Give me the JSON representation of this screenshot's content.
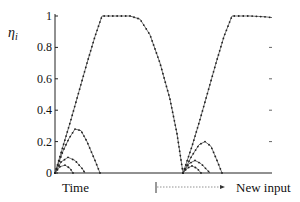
{
  "chart_data": {
    "type": "line",
    "title": "",
    "ylabel": "η_i",
    "ylabel_main": "η",
    "ylabel_sub": "i",
    "xlabel": "Time",
    "annotation": "New input",
    "ylim": [
      0,
      1
    ],
    "yticks": [
      "0",
      "0.2",
      "0.4",
      "0.6",
      "0.8",
      "1"
    ],
    "grid": false,
    "legend": null,
    "x_units": "arbitrary (pixel-proportional time, 0 = origin, 217 = end of axis)",
    "series": [
      {
        "name": "winner (main curve)",
        "marker": "dot",
        "points": [
          [
            0,
            0
          ],
          [
            8,
            0.17
          ],
          [
            16,
            0.34
          ],
          [
            24,
            0.52
          ],
          [
            32,
            0.7
          ],
          [
            40,
            0.87
          ],
          [
            47,
            1.0
          ],
          [
            60,
            1.0
          ],
          [
            75,
            1.0
          ],
          [
            85,
            0.98
          ],
          [
            95,
            0.88
          ],
          [
            105,
            0.7
          ],
          [
            115,
            0.47
          ],
          [
            122,
            0.25
          ],
          [
            128,
            0.0
          ],
          [
            137,
            0.17
          ],
          [
            145,
            0.34
          ],
          [
            153,
            0.52
          ],
          [
            161,
            0.7
          ],
          [
            169,
            0.87
          ],
          [
            177,
            1.0
          ],
          [
            195,
            1.0
          ],
          [
            210,
            0.995
          ],
          [
            217,
            0.99
          ]
        ]
      },
      {
        "name": "competitor 1 (first episode)",
        "marker": "dot",
        "points": [
          [
            0,
            0
          ],
          [
            8,
            0.14
          ],
          [
            14,
            0.22
          ],
          [
            20,
            0.28
          ],
          [
            26,
            0.27
          ],
          [
            32,
            0.2
          ],
          [
            40,
            0.08
          ],
          [
            45,
            0.0
          ]
        ]
      },
      {
        "name": "competitor 2 (first episode)",
        "marker": "dot",
        "points": [
          [
            0,
            0
          ],
          [
            6,
            0.07
          ],
          [
            13,
            0.1
          ],
          [
            20,
            0.08
          ],
          [
            27,
            0.03
          ],
          [
            30,
            0.0
          ]
        ]
      },
      {
        "name": "competitor 3 (first episode)",
        "marker": "dot",
        "points": [
          [
            0,
            0
          ],
          [
            5,
            0.04
          ],
          [
            10,
            0.05
          ],
          [
            15,
            0.03
          ],
          [
            18,
            0.0
          ]
        ]
      },
      {
        "name": "competitor 1 (second episode)",
        "marker": "dot",
        "points": [
          [
            128,
            0
          ],
          [
            136,
            0.1
          ],
          [
            144,
            0.18
          ],
          [
            150,
            0.2
          ],
          [
            156,
            0.17
          ],
          [
            162,
            0.08
          ],
          [
            167,
            0.0
          ]
        ]
      },
      {
        "name": "competitor 2 (second episode)",
        "marker": "dot",
        "points": [
          [
            128,
            0
          ],
          [
            134,
            0.06
          ],
          [
            140,
            0.08
          ],
          [
            146,
            0.06
          ],
          [
            152,
            0.02
          ],
          [
            155,
            0.0
          ]
        ]
      },
      {
        "name": "competitor 3 (second episode)",
        "marker": "dot",
        "points": [
          [
            128,
            0
          ],
          [
            132,
            0.03
          ],
          [
            137,
            0.045
          ],
          [
            142,
            0.03
          ],
          [
            146,
            0.0
          ]
        ]
      }
    ]
  },
  "labels": {
    "y_axis_symbol": "η",
    "y_axis_subscript": "i",
    "x_label": "Time",
    "new_input_label": "New input",
    "yticks": [
      "0",
      "0.2",
      "0.4",
      "0.6",
      "0.8",
      "1"
    ]
  }
}
